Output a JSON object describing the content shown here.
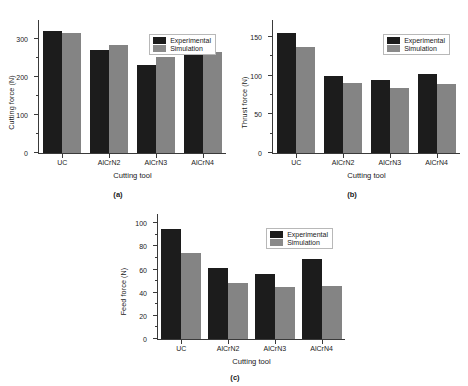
{
  "figure": {
    "background": "#ffffff",
    "series_colors": {
      "experimental": "#1c1c1c",
      "simulation": "#848484"
    }
  },
  "legend": {
    "experimental": "Experimental",
    "simulation": "Simulation"
  },
  "chart_data": [
    {
      "type": "bar",
      "panel": "a",
      "caption": "(a)",
      "title": "",
      "xlabel": "Cutting tool",
      "ylabel": "Cutting force (N)",
      "categories": [
        "UC",
        "AlCrN2",
        "AlCrN3",
        "AlCrN4"
      ],
      "series": [
        {
          "name": "Experimental",
          "values": [
            320,
            271,
            232,
            288
          ],
          "color": "#1c1c1c"
        },
        {
          "name": "Simulation",
          "values": [
            317,
            284,
            253,
            267
          ],
          "color": "#848484"
        }
      ],
      "ylim": [
        0,
        350
      ],
      "yticks": [
        0,
        100,
        200,
        300
      ],
      "yticks_minor": [
        50,
        150,
        250
      ],
      "ytick_labels": [
        "0",
        "100",
        "200",
        "300"
      ],
      "grid": false,
      "legend_position": "top-right"
    },
    {
      "type": "bar",
      "panel": "b",
      "caption": "(b)",
      "title": "",
      "xlabel": "Cutting tool",
      "ylabel": "Thrust force (N)",
      "categories": [
        "UC",
        "AlCrN2",
        "AlCrN3",
        "AlCrN4"
      ],
      "series": [
        {
          "name": "Experimental",
          "values": [
            155,
            100,
            95,
            102
          ],
          "color": "#1c1c1c"
        },
        {
          "name": "Simulation",
          "values": [
            137,
            91,
            84,
            89
          ],
          "color": "#848484"
        }
      ],
      "ylim": [
        0,
        172
      ],
      "yticks": [
        0,
        50,
        100,
        150
      ],
      "yticks_minor": [
        25,
        75,
        125
      ],
      "ytick_labels": [
        "0",
        "50",
        "100",
        "150"
      ],
      "grid": false,
      "legend_position": "top-right"
    },
    {
      "type": "bar",
      "panel": "c",
      "caption": "(c)",
      "title": "",
      "xlabel": "Cutting tool",
      "ylabel": "Feed force (N)",
      "categories": [
        "UC",
        "AlCrN2",
        "AlCrN3",
        "AlCrN4"
      ],
      "series": [
        {
          "name": "Experimental",
          "values": [
            95,
            61,
            56,
            69
          ],
          "color": "#1c1c1c"
        },
        {
          "name": "Simulation",
          "values": [
            74,
            48,
            45,
            46
          ],
          "color": "#848484"
        }
      ],
      "ylim": [
        0,
        108
      ],
      "yticks": [
        0,
        20,
        40,
        60,
        80,
        100
      ],
      "yticks_minor": [
        10,
        30,
        50,
        70,
        90
      ],
      "ytick_labels": [
        "0",
        "20",
        "40",
        "60",
        "80",
        "100"
      ],
      "grid": false,
      "legend_position": "top-right"
    }
  ]
}
